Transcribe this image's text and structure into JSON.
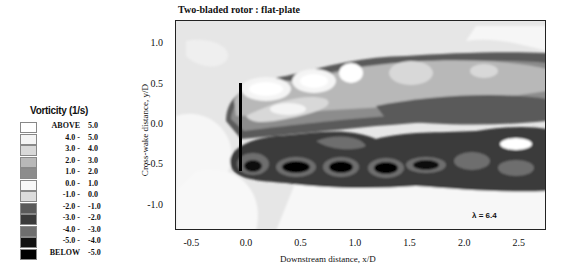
{
  "chart_data": {
    "type": "heatmap",
    "title": "Two-bladed rotor : flat-plate",
    "xlabel": "Downstream distance, x/D",
    "ylabel": "Cross-wake distance, y/D",
    "xlim": [
      -0.65,
      2.75
    ],
    "ylim": [
      -1.3,
      1.3
    ],
    "x_ticks": [
      "-0.5",
      "0.0",
      "0.5",
      "1.0",
      "1.5",
      "2.0",
      "2.5"
    ],
    "y_ticks": [
      "1.0",
      "0.5",
      "0.0",
      "-0.5",
      "-1.0"
    ],
    "annotation": "λ = 6.4",
    "rotor_line": {
      "x": 0.0,
      "y_from": -0.4,
      "y_to": 0.55
    },
    "legend": {
      "title": "Vorticity (1/s)",
      "entries": [
        {
          "lo": "ABOVE",
          "hi": "5.0",
          "color": "#ffffff"
        },
        {
          "lo": "4.0 -",
          "hi": "5.0",
          "color": "#f4f4f4"
        },
        {
          "lo": "3.0 -",
          "hi": "4.0",
          "color": "#d8d8d8"
        },
        {
          "lo": "2.0 -",
          "hi": "3.0",
          "color": "#b8b8b8"
        },
        {
          "lo": "1.0 -",
          "hi": "2.0",
          "color": "#8c8c8c"
        },
        {
          "lo": "0.0 -",
          "hi": "1.0",
          "color": "#f8f8f8"
        },
        {
          "lo": "-1.0 -",
          "hi": "0.0",
          "color": "#dcdcdc"
        },
        {
          "lo": "-2.0 -",
          "hi": "-1.0",
          "color": "#5a5a5a"
        },
        {
          "lo": "-3.0 -",
          "hi": "-2.0",
          "color": "#3a3a3a"
        },
        {
          "lo": "-4.0 -",
          "hi": "-3.0",
          "color": "#6e6e6e"
        },
        {
          "lo": "-5.0 -",
          "hi": "-4.0",
          "color": "#111111"
        },
        {
          "lo": "BELOW",
          "hi": "-5.0",
          "color": "#000000"
        }
      ]
    },
    "features": [
      {
        "name": "upper positive vortex trail",
        "y_range": [
          0.25,
          0.75
        ],
        "x_range": [
          0.05,
          2.75
        ],
        "sign": "positive"
      },
      {
        "name": "lower negative vortex trail",
        "y_range": [
          -0.65,
          -0.1
        ],
        "x_range": [
          -0.05,
          2.75
        ],
        "sign": "negative"
      }
    ]
  }
}
